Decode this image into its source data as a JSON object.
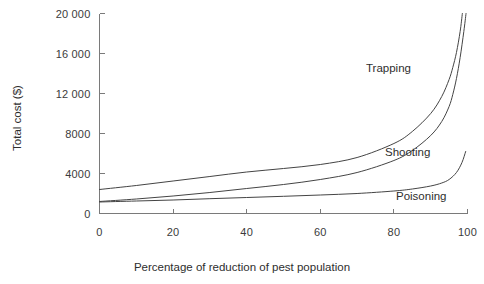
{
  "chart_data": {
    "type": "line",
    "title": "",
    "xlabel": "Percentage of reduction of pest population",
    "ylabel": "Total cost ($)",
    "xlim": [
      0,
      100
    ],
    "ylim": [
      0,
      20000
    ],
    "grid": false,
    "legend_position": "inline-annotations",
    "xticks": [
      0,
      20,
      40,
      60,
      80,
      100
    ],
    "xtick_labels": [
      "0",
      "20",
      "40",
      "60",
      "80",
      "100"
    ],
    "yticks": [
      0,
      4000,
      8000,
      12000,
      16000,
      20000
    ],
    "ytick_labels": [
      "0",
      "4000",
      "8000",
      "12 000",
      "16 000",
      "20 000"
    ],
    "series": [
      {
        "name": "Trapping",
        "color": "#444444",
        "x": [
          0,
          10,
          20,
          30,
          40,
          50,
          60,
          70,
          80,
          85,
          90,
          93,
          95,
          96,
          97,
          98,
          98.6
        ],
        "values": [
          2400,
          2800,
          3250,
          3700,
          4150,
          4500,
          4900,
          5600,
          7000,
          8200,
          10000,
          11700,
          13400,
          14600,
          16100,
          18200,
          20000
        ]
      },
      {
        "name": "Shooting",
        "color": "#444444",
        "x": [
          0,
          10,
          20,
          30,
          40,
          50,
          60,
          70,
          80,
          85,
          90,
          93,
          95,
          96,
          97,
          98,
          99,
          99.6
        ],
        "values": [
          1200,
          1450,
          1750,
          2100,
          2500,
          2900,
          3400,
          4100,
          5300,
          6300,
          7800,
          9200,
          10700,
          11900,
          13500,
          15600,
          18200,
          20000
        ]
      },
      {
        "name": "Poisoning",
        "color": "#444444",
        "x": [
          0,
          10,
          20,
          30,
          40,
          50,
          60,
          70,
          80,
          85,
          90,
          93,
          95,
          97,
          98.5,
          99.5
        ],
        "values": [
          1150,
          1250,
          1350,
          1480,
          1600,
          1720,
          1850,
          2000,
          2250,
          2450,
          2750,
          3050,
          3400,
          4100,
          5100,
          6200
        ]
      }
    ]
  },
  "axes": {
    "y_title": "Total cost ($)",
    "x_title": "Percentage of reduction of pest population"
  },
  "annotations": {
    "trapping": "Trapping",
    "shooting": "Shooting",
    "poisoning": "Poisoning"
  },
  "colors": {
    "background": "#ffffff",
    "axis": "#7a7a7a",
    "curve": "#444444",
    "text": "#3b3b3b"
  }
}
